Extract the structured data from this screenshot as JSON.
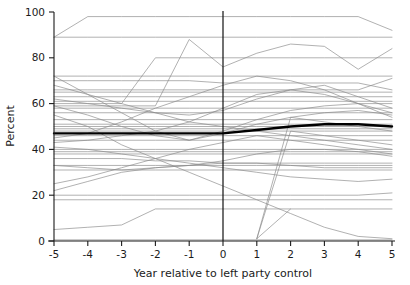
{
  "chart_data": {
    "type": "line",
    "title": "",
    "xlabel": "Year relative to left party control",
    "ylabel": "Percent",
    "xlim": [
      -5,
      5
    ],
    "ylim": [
      0,
      100
    ],
    "x": [
      -5,
      -4,
      -3,
      -2,
      -1,
      0,
      1,
      2,
      3,
      4,
      5
    ],
    "xticks": [
      -5,
      -4,
      -3,
      -2,
      -1,
      0,
      1,
      2,
      3,
      4,
      5
    ],
    "xtick_labels": [
      "-5",
      "-4",
      "-3",
      "-2",
      "-1",
      "0",
      "1",
      "2",
      "3",
      "4",
      "5"
    ],
    "yticks": [
      0,
      20,
      40,
      60,
      80,
      100
    ],
    "ytick_labels": [
      "0",
      "20",
      "40",
      "60",
      "80",
      "100"
    ],
    "grid": false,
    "legend": "none",
    "annotations": [
      {
        "type": "vline",
        "x": 0,
        "label": "left party control onset",
        "color": "#111111"
      }
    ],
    "series_style": {
      "spaghetti_color": "#8c8c8c",
      "spaghetti_width": 0.8,
      "mean_color": "#000000",
      "mean_width": 2.4
    },
    "series": [
      {
        "name": "unit-01",
        "kind": "spaghetti",
        "values": [
          89,
          98,
          98,
          98,
          98,
          98,
          98,
          98,
          98,
          98,
          92
        ]
      },
      {
        "name": "unit-02",
        "kind": "spaghetti",
        "values": [
          89,
          89,
          89,
          89,
          89,
          89,
          89,
          89,
          89,
          89,
          89
        ]
      },
      {
        "name": "unit-03",
        "kind": "spaghetti",
        "values": [
          60,
          60,
          60,
          80,
          80,
          80,
          80,
          80,
          80,
          80,
          80
        ]
      },
      {
        "name": "unit-04",
        "kind": "spaghetti",
        "values": [
          59,
          59,
          59,
          59,
          88,
          76,
          82,
          86,
          85,
          75,
          84
        ]
      },
      {
        "name": "unit-05",
        "kind": "spaghetti",
        "values": [
          72,
          72,
          72,
          72,
          72,
          72,
          72,
          72,
          72,
          72,
          72
        ]
      },
      {
        "name": "unit-06",
        "kind": "spaghetti",
        "values": [
          70,
          70,
          70,
          70,
          70,
          69,
          69,
          69,
          69,
          69,
          66
        ]
      },
      {
        "name": "unit-07",
        "kind": "spaghetti",
        "values": [
          66,
          66,
          66,
          66,
          66,
          66,
          66,
          66,
          66,
          66,
          71
        ]
      },
      {
        "name": "unit-08",
        "kind": "spaghetti",
        "values": [
          65,
          65,
          65,
          65,
          65,
          65,
          65,
          65,
          65,
          65,
          65
        ]
      },
      {
        "name": "unit-09",
        "kind": "spaghetti",
        "values": [
          63,
          63,
          63,
          63,
          63,
          63,
          63,
          63,
          63,
          63,
          63
        ]
      },
      {
        "name": "unit-10",
        "kind": "spaghetti",
        "values": [
          62,
          60,
          58,
          56,
          55,
          57,
          62,
          66,
          68,
          63,
          58
        ]
      },
      {
        "name": "unit-11",
        "kind": "spaghetti",
        "values": [
          61,
          61,
          61,
          61,
          61,
          61,
          61,
          61,
          61,
          61,
          61
        ]
      },
      {
        "name": "unit-12",
        "kind": "spaghetti",
        "values": [
          59,
          55,
          50,
          46,
          44,
          48,
          53,
          57,
          59,
          60,
          60
        ]
      },
      {
        "name": "unit-13",
        "kind": "spaghetti",
        "values": [
          58,
          58,
          58,
          58,
          58,
          58,
          58,
          58,
          58,
          58,
          58
        ]
      },
      {
        "name": "unit-14",
        "kind": "spaghetti",
        "values": [
          56,
          56,
          56,
          56,
          56,
          56,
          56,
          56,
          56,
          56,
          56
        ]
      },
      {
        "name": "unit-15",
        "kind": "spaghetti",
        "values": [
          72,
          64,
          56,
          48,
          44,
          47,
          51,
          54,
          56,
          57,
          55
        ]
      },
      {
        "name": "unit-16",
        "kind": "spaghetti",
        "values": [
          53,
          53,
          53,
          53,
          53,
          53,
          53,
          53,
          53,
          53,
          53
        ]
      },
      {
        "name": "unit-17",
        "kind": "spaghetti",
        "values": [
          51,
          51,
          51,
          51,
          51,
          51,
          51,
          51,
          51,
          51,
          51
        ]
      },
      {
        "name": "unit-18",
        "kind": "spaghetti",
        "values": [
          50,
          50,
          50,
          50,
          50,
          50,
          50,
          50,
          50,
          50,
          50
        ]
      },
      {
        "name": "unit-19",
        "kind": "spaghetti",
        "values": [
          49,
          49,
          49,
          49,
          49,
          49,
          49,
          49,
          49,
          49,
          49
        ]
      },
      {
        "name": "unit-20",
        "kind": "spaghetti",
        "values": [
          48,
          48,
          48,
          48,
          48,
          48,
          48,
          48,
          48,
          48,
          48
        ]
      },
      {
        "name": "unit-21",
        "kind": "spaghetti",
        "values": [
          46,
          46,
          46,
          46,
          46,
          46,
          46,
          46,
          46,
          46,
          46
        ]
      },
      {
        "name": "unit-22",
        "kind": "spaghetti",
        "values": [
          44,
          44,
          44,
          44,
          44,
          44,
          44,
          44,
          44,
          44,
          44
        ]
      },
      {
        "name": "unit-23",
        "kind": "spaghetti",
        "values": [
          40,
          40,
          40,
          40,
          40,
          40,
          40,
          40,
          40,
          40,
          40
        ]
      },
      {
        "name": "unit-24",
        "kind": "spaghetti",
        "values": [
          39,
          39,
          39,
          39,
          39,
          39,
          39,
          39,
          39,
          39,
          39
        ]
      },
      {
        "name": "unit-25",
        "kind": "spaghetti",
        "values": [
          38,
          38,
          38,
          38,
          38,
          38,
          38,
          38,
          38,
          38,
          38
        ]
      },
      {
        "name": "unit-26",
        "kind": "spaghetti",
        "values": [
          36,
          36,
          36,
          35,
          35,
          34,
          34,
          34,
          34,
          34,
          34
        ]
      },
      {
        "name": "unit-27",
        "kind": "spaghetti",
        "values": [
          33,
          33,
          33,
          33,
          33,
          33,
          33,
          33,
          33,
          33,
          33
        ]
      },
      {
        "name": "unit-28",
        "kind": "spaghetti",
        "values": [
          33,
          32,
          31,
          32,
          33,
          34,
          34,
          33,
          32,
          32,
          32
        ]
      },
      {
        "name": "unit-29",
        "kind": "spaghetti",
        "values": [
          31,
          31,
          31,
          31,
          31,
          31,
          31,
          31,
          31,
          31,
          31
        ]
      },
      {
        "name": "unit-30",
        "kind": "spaghetti",
        "values": [
          22,
          26,
          30,
          32,
          33,
          35,
          38,
          40,
          40,
          39,
          37
        ]
      },
      {
        "name": "unit-31",
        "kind": "spaghetti",
        "values": [
          41,
          40,
          38,
          36,
          34,
          32,
          30,
          28,
          27,
          26,
          27
        ]
      },
      {
        "name": "unit-32",
        "kind": "spaghetti",
        "values": [
          20,
          20,
          20,
          20,
          20,
          20,
          20,
          20,
          20,
          20,
          21
        ]
      },
      {
        "name": "unit-33",
        "kind": "spaghetti",
        "values": [
          18,
          18,
          18,
          18,
          18,
          18,
          18,
          18,
          18,
          18,
          18
        ]
      },
      {
        "name": "unit-34",
        "kind": "spaghetti",
        "values": [
          5,
          6,
          7,
          14,
          14,
          14,
          14,
          14,
          14,
          14,
          14
        ]
      },
      {
        "name": "unit-35",
        "kind": "spaghetti",
        "values": [
          0.5,
          0.5,
          0.5,
          0.5,
          0.5,
          0.5,
          0.5,
          0.5,
          0.5,
          0.5,
          0.5
        ]
      },
      {
        "name": "unit-36",
        "kind": "spaghetti",
        "values": [
          55,
          50,
          42,
          36,
          30,
          24,
          18,
          12,
          6,
          2,
          1
        ],
        "partial": true
      },
      {
        "name": "unit-37",
        "kind": "spaghetti",
        "values": [
          null,
          null,
          null,
          null,
          null,
          null,
          1,
          48,
          46,
          44,
          42
        ]
      },
      {
        "name": "unit-38",
        "kind": "spaghetti",
        "values": [
          null,
          null,
          null,
          null,
          null,
          null,
          1,
          54,
          52,
          50,
          48
        ]
      },
      {
        "name": "unit-39",
        "kind": "spaghetti",
        "values": [
          null,
          null,
          null,
          null,
          null,
          null,
          1,
          14,
          null,
          null,
          null
        ]
      },
      {
        "name": "unit-40",
        "kind": "spaghetti",
        "values": [
          45,
          47,
          52,
          58,
          63,
          68,
          72,
          70,
          66,
          60,
          54
        ]
      },
      {
        "name": "unit-41",
        "kind": "spaghetti",
        "values": [
          43,
          44,
          46,
          48,
          52,
          58,
          64,
          66,
          64,
          60,
          56
        ]
      },
      {
        "name": "unit-42",
        "kind": "spaghetti",
        "values": [
          68,
          64,
          60,
          56,
          52,
          50,
          48,
          46,
          44,
          42,
          40
        ]
      },
      {
        "name": "unit-43",
        "kind": "spaghetti",
        "values": [
          25,
          28,
          32,
          36,
          40,
          43,
          46,
          44,
          42,
          40,
          38
        ]
      },
      {
        "name": "unit-mean",
        "kind": "mean",
        "values": [
          47,
          47,
          47,
          47,
          47,
          47,
          48.5,
          50,
          51,
          51,
          50
        ]
      }
    ]
  }
}
